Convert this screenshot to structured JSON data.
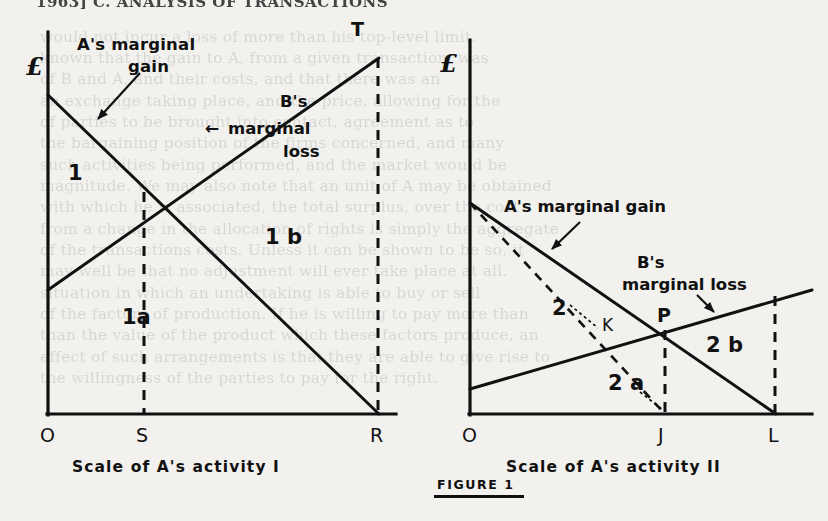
{
  "page": {
    "running_head": "1963]     C. ANALYSIS OF TRANSACTIONS",
    "background_color": "#f2f1ee",
    "ink_color": "#111111"
  },
  "figure": {
    "caption": "FIGURE 1",
    "panels": [
      {
        "id": "panel-left",
        "y_axis_label": "£",
        "x_axis_caption": "Scale of A's activity I",
        "annotations": [
          {
            "name": "a-marginal-gain",
            "text_lines": [
              "A's marginal",
              "gain"
            ]
          },
          {
            "name": "b-marginal-loss",
            "text_lines": [
              "B's",
              "marginal",
              "loss"
            ],
            "arrow": "←"
          }
        ],
        "region_labels": [
          "1",
          "1 b",
          "1a"
        ],
        "point_labels": [
          "T",
          "O",
          "S",
          "R"
        ],
        "axis_points": {
          "origin": "O",
          "equilibrium": "S",
          "right": "R",
          "top": "T"
        }
      },
      {
        "id": "panel-right",
        "y_axis_label": "£",
        "x_axis_caption": "Scale of A's activity II",
        "annotations": [
          {
            "name": "a-marginal-gain",
            "text_lines": [
              "A's marginal gain"
            ]
          },
          {
            "name": "b-marginal-loss",
            "text_lines": [
              "B's",
              "marginal loss"
            ]
          }
        ],
        "region_labels": [
          "2",
          "2 b",
          "2 a"
        ],
        "point_labels": [
          "K",
          "P",
          "O",
          "J",
          "L"
        ],
        "axis_points": {
          "origin": "O",
          "equilibrium": "J",
          "right": "L",
          "intersection": "P",
          "dashed_cross": "K"
        }
      }
    ]
  },
  "ghost_text": {
    "lines": [
      {
        "x": 40,
        "y": 28,
        "text": "would not incur a loss of more than his top-level limit."
      },
      {
        "x": 40,
        "y": 49,
        "text": "known that the gain to A, from a given transaction, was"
      },
      {
        "x": 40,
        "y": 70,
        "text": "of B and A, and their costs, and that there was an"
      },
      {
        "x": 40,
        "y": 92,
        "text": "an exchange taking place, and the price, allowing for the"
      },
      {
        "x": 40,
        "y": 113,
        "text": "of parties to be brought into contact, agreement as to"
      },
      {
        "x": 40,
        "y": 134,
        "text": "the bargaining position of the firms concerned, and many"
      },
      {
        "x": 40,
        "y": 156,
        "text": "such activities being performed, and the market would be"
      },
      {
        "x": 40,
        "y": 177,
        "text": "magnitude. We may also note that an unit of A may be obtained"
      },
      {
        "x": 40,
        "y": 198,
        "text": "with which he is associated, the total surplus, over the cost"
      },
      {
        "x": 40,
        "y": 220,
        "text": "from a change in the allocation of rights is simply the aggregate"
      },
      {
        "x": 40,
        "y": 241,
        "text": "of the transactions costs. Unless it can be shown to be so,  it"
      },
      {
        "x": 40,
        "y": 262,
        "text": "may well be that no adjustment will ever take place at all."
      },
      {
        "x": 40,
        "y": 284,
        "text": "situation in which an undertaking is able to buy or sell"
      },
      {
        "x": 40,
        "y": 305,
        "text": "of the factors of production. If he is willing to pay more than"
      },
      {
        "x": 40,
        "y": 326,
        "text": "than the value of the product which these factors produce, an"
      },
      {
        "x": 40,
        "y": 348,
        "text": "effect of such arrangements is that they are able to give rise to"
      },
      {
        "x": 40,
        "y": 369,
        "text": "the willingness of the parties to pay for the right."
      }
    ]
  }
}
